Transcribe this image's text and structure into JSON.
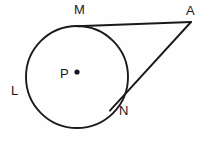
{
  "figure": {
    "background_color": "#fefefe",
    "stroke_color": "#1a1a1a",
    "labels": {
      "tangent_point_top": "M",
      "external_point": "A",
      "arc_point_left": "L",
      "center": "P",
      "tangent_point_lower": "N"
    }
  },
  "geometry": {
    "circle": {
      "center_x": 77,
      "center_y": 77,
      "radius": 51,
      "stroke_width": 1.9
    },
    "center_dot": {
      "x": 77,
      "y": 72,
      "radius": 2.6
    },
    "points": {
      "M": {
        "x": 84,
        "y": 26
      },
      "A": {
        "x": 191,
        "y": 22
      },
      "N": {
        "x": 116,
        "y": 104
      },
      "L": {
        "x": 27,
        "y": 88
      },
      "P": {
        "x": 77,
        "y": 72
      }
    },
    "segments": [
      {
        "name": "tangent-MA",
        "from": "M",
        "to": "A"
      },
      {
        "name": "tangent-AN",
        "from": "A",
        "to": "N"
      }
    ],
    "stroke_width_lines": 1.9
  }
}
